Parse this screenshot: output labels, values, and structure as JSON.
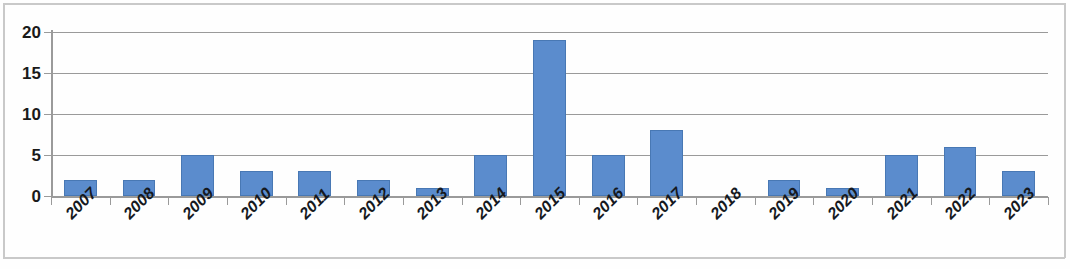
{
  "chart_data": {
    "type": "bar",
    "title": "",
    "subtitle": "",
    "xlabel": "",
    "ylabel": "",
    "categories": [
      "2007",
      "2008",
      "2009",
      "2010",
      "2011",
      "2012",
      "2013",
      "2014",
      "2015",
      "2016",
      "2017",
      "2018",
      "2019",
      "2020",
      "2021",
      "2022",
      "2023"
    ],
    "values": [
      2,
      2,
      5,
      3,
      3,
      2,
      1,
      5,
      19,
      5,
      8,
      0,
      2,
      1,
      5,
      6,
      3
    ],
    "series": [
      {
        "name": "",
        "values": [
          2,
          2,
          5,
          3,
          3,
          2,
          1,
          5,
          19,
          5,
          8,
          0,
          2,
          1,
          5,
          6,
          3
        ]
      }
    ],
    "ylim": [
      0,
      20
    ],
    "y_ticks": [
      0,
      5,
      10,
      15,
      20
    ],
    "y_tick_labels": [
      "0",
      "5",
      "10",
      "15",
      "20"
    ],
    "grid": true,
    "grid_axis": "y",
    "legend": false,
    "legend_position": "none",
    "bar_color": "#5b8ccd",
    "bar_edge_color": "#4878b4",
    "gridline_color": "#9a9a9a",
    "axis_color": "#9a9a9a",
    "text_color": "#15191f",
    "background_color": "#fefefe",
    "x_tick_label_rotation": -45
  }
}
